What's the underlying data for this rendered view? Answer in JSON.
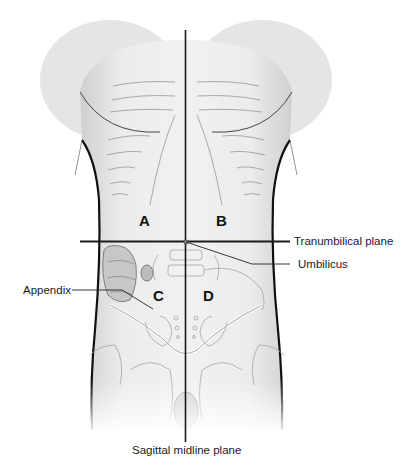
{
  "diagram": {
    "quadrants": [
      {
        "id": "A",
        "label": "A"
      },
      {
        "id": "B",
        "label": "B"
      },
      {
        "id": "C",
        "label": "C"
      },
      {
        "id": "D",
        "label": "D"
      }
    ],
    "annotations": {
      "transumbilical": "Tranumbilical plane",
      "umbilicus": "Umbilicus",
      "appendix": "Appendix",
      "sagittal": "Sagittal midline plane"
    },
    "colors": {
      "line": "#1a1a1a",
      "skin_shade": "#d4d4d4",
      "outline": "#111111",
      "bone": "#bdbdbd"
    }
  }
}
